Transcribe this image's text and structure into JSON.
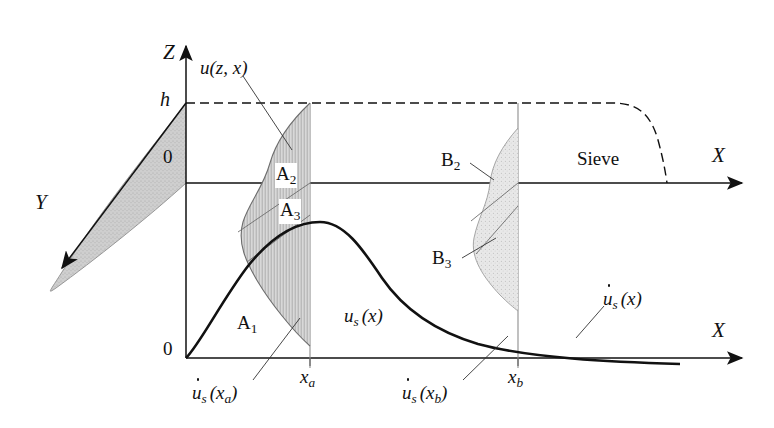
{
  "figure": {
    "type": "technical-diagram",
    "background": "#ffffff",
    "ink": "#111111",
    "shade_fill": "#c9c9c9",
    "shade_fill_light": "#e2e2e2"
  },
  "axes": {
    "z_label": "Z",
    "y_label": "Y",
    "x_label_upper": "X",
    "x_label_lower": "X",
    "origin_upper": "0",
    "origin_lower": "0",
    "height_label": "h"
  },
  "labels": {
    "profile": "u(z, x)",
    "sieve": "Sieve",
    "a2": "A",
    "a2_sub": "2",
    "a3": "A",
    "a3_sub": "3",
    "a1": "A",
    "a1_sub": "1",
    "b2": "B",
    "b2_sub": "2",
    "b3": "B",
    "b3_sub": "3",
    "us_x": "u",
    "us_x_sub": "s",
    "us_x_arg": "(x)",
    "udot_s_x": "u",
    "udot_s_x_sub": "s",
    "udot_s_x_arg": "(x)",
    "udot_s_xa": "u",
    "udot_s_xa_sub": "s",
    "udot_s_xa_arg_open": "(x",
    "udot_s_xa_arg_sub": "a",
    "udot_s_xa_arg_close": ")",
    "udot_s_xb": "u",
    "udot_s_xb_sub": "s",
    "udot_s_xb_arg_open": "(x",
    "udot_s_xb_arg_sub": "b",
    "udot_s_xb_arg_close": ")",
    "xa": "x",
    "xa_sub": "a",
    "xb": "x",
    "xb_sub": "b"
  },
  "geometry": {
    "z_axis_x": 186,
    "upper_x_axis_y": 183,
    "lower_x_axis_y": 358,
    "h_line_y": 103,
    "section_xa": 310,
    "section_xb": 518,
    "curve_peak": [
      320,
      222
    ],
    "x_axis_right_end": 742
  }
}
